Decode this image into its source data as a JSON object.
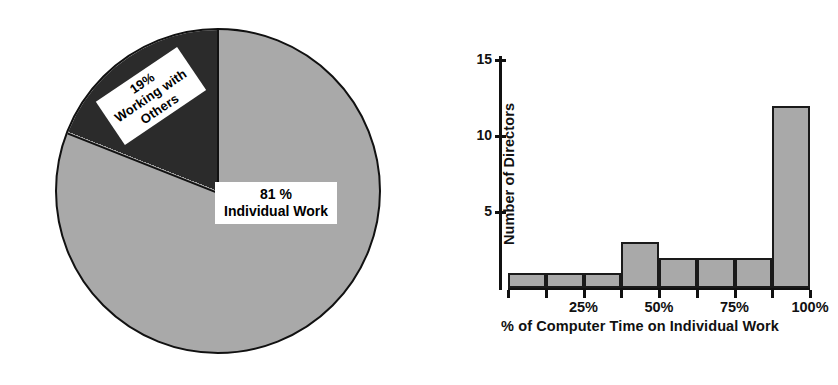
{
  "chart_data": [
    {
      "type": "pie",
      "title": "",
      "labels": [
        "Individual Work",
        "Working with Others"
      ],
      "values": [
        81,
        19
      ],
      "unit": "%",
      "slice_label_texts": [
        "81 %\nIndividual Work",
        "19%\nWorking with\nOthers"
      ],
      "colors": [
        "#a9a9a9",
        "#2b2b2b"
      ],
      "legend": "none",
      "grid": false
    },
    {
      "type": "bar",
      "title": "",
      "xlabel": "% of Computer Time on Individual Work",
      "ylabel": "Number of Directors",
      "categories": [
        "0-12.5%",
        "12.5-25%",
        "25-37.5%",
        "37.5-50%",
        "50-62.5%",
        "62.5-75%",
        "75-87.5%",
        "87.5-100%"
      ],
      "values": [
        1,
        1,
        1,
        3,
        2,
        2,
        2,
        12
      ],
      "ylim": [
        0,
        15
      ],
      "ytick_labels": [
        "15",
        "10",
        "5"
      ],
      "ytick_values": [
        15,
        10,
        5
      ],
      "xtick_labels": [
        "25%",
        "50%",
        "75%",
        "100%"
      ],
      "xtick_values": [
        25,
        50,
        75,
        100
      ],
      "bar_color": "#a9a9a9",
      "bar_edge_color": "#1a1a1a",
      "grid": false,
      "legend": "none"
    }
  ],
  "pie": {
    "label_others": "19%\nWorking with\nOthers",
    "label_individual": "81 %\nIndividual Work"
  },
  "bar": {
    "y_axis_title": "Number of Directors",
    "x_axis_title": "% of Computer Time on Individual Work",
    "y_ticks": [
      {
        "label": "15"
      },
      {
        "label": "10"
      },
      {
        "label": "5"
      }
    ],
    "x_ticks": [
      {
        "label": "25%"
      },
      {
        "label": "50%"
      },
      {
        "label": "75%"
      },
      {
        "label": "100%"
      }
    ]
  }
}
